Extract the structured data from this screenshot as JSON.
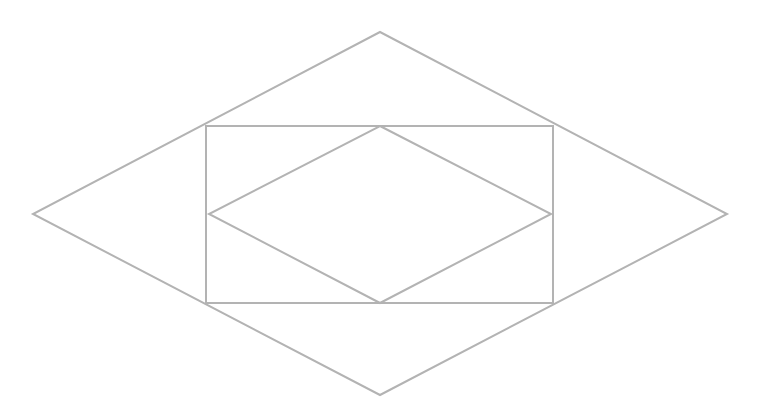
{
  "diagram": {
    "type": "nested-geometric-figure",
    "stroke_color": "#b3b3b3",
    "stroke_width": 2,
    "background": "#ffffff",
    "outer_rhombus": {
      "top": [
        380,
        32
      ],
      "right": [
        727,
        214
      ],
      "bottom": [
        380,
        395
      ],
      "left": [
        33,
        214
      ]
    },
    "rectangle": {
      "x": 206,
      "y": 126,
      "width": 347,
      "height": 177
    },
    "inner_rhombus": {
      "top": [
        380,
        126
      ],
      "right": [
        551,
        214
      ],
      "bottom": [
        380,
        303
      ],
      "left": [
        209,
        214
      ]
    }
  }
}
